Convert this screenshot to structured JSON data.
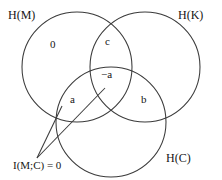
{
  "diagram": {
    "type": "venn-3-circle",
    "title_visible": false,
    "background_color": "#ffffff",
    "stroke_color": "#3a3a3a",
    "text_color": "#151515",
    "set_labels": [
      {
        "id": "H_M",
        "text": "H(M)",
        "position": "top-left"
      },
      {
        "id": "H_K",
        "text": "H(K)",
        "position": "top-right"
      },
      {
        "id": "H_C",
        "text": "H(C)",
        "position": "bottom-right"
      }
    ],
    "region_labels": [
      {
        "id": "m-only",
        "text": "0",
        "region": "H(M) only"
      },
      {
        "id": "mk",
        "text": "c",
        "region": "H(M) ∩ H(K)"
      },
      {
        "id": "mkc",
        "text": "−a",
        "region": "H(M) ∩ H(K) ∩ H(C)"
      },
      {
        "id": "mc",
        "text": "a",
        "region": "H(M) ∩ H(C)"
      },
      {
        "id": "kc",
        "text": "b",
        "region": "H(K) ∩ H(C)"
      }
    ],
    "annotation": {
      "id": "mutual-information-note",
      "text": "I(M;C) = 0",
      "leader_lines": 2
    },
    "circles": [
      {
        "id": "H_M",
        "cx": 77,
        "cy": 67,
        "r": 55
      },
      {
        "id": "H_K",
        "cx": 145,
        "cy": 67,
        "r": 55
      },
      {
        "id": "H_C",
        "cx": 111,
        "cy": 122,
        "r": 55
      }
    ]
  }
}
